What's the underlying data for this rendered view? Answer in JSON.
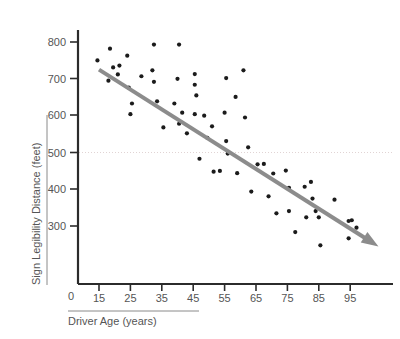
{
  "chart_data": {
    "type": "scatter",
    "title": "",
    "xlabel": "Driver Age (years)",
    "ylabel": "Sign Legibility Distance (feet)",
    "xlim": [
      10,
      102
    ],
    "ylim": [
      200,
      830
    ],
    "xticks": [
      15,
      25,
      35,
      45,
      55,
      65,
      75,
      85,
      95
    ],
    "yticks": [
      300,
      400,
      500,
      600,
      700,
      800
    ],
    "origin_label": "0",
    "grid": false,
    "reference_lines": [
      {
        "axis": "y",
        "value": 500,
        "style": "dotted",
        "color": "#d9c9c9"
      }
    ],
    "legend": "none",
    "annotations": [],
    "colors": {
      "point": "#1b1b1b",
      "trend": "#8c8c8c",
      "axis": "#2b2b2b",
      "text": "#555555",
      "gridline": "#d9c9c9",
      "background": "#ffffff"
    },
    "trend_line": {
      "type": "linear-fit-with-arrow",
      "x_start": 15,
      "y_start": 725,
      "x_end": 104,
      "y_end": 245,
      "color": "#8c8c8c"
    },
    "points": [
      {
        "x": 14.5,
        "y": 750
      },
      {
        "x": 18.5,
        "y": 782
      },
      {
        "x": 18.0,
        "y": 695
      },
      {
        "x": 19.5,
        "y": 731
      },
      {
        "x": 21.5,
        "y": 736
      },
      {
        "x": 21.0,
        "y": 712
      },
      {
        "x": 24.0,
        "y": 763
      },
      {
        "x": 24.5,
        "y": 676
      },
      {
        "x": 25.5,
        "y": 633
      },
      {
        "x": 25.0,
        "y": 604
      },
      {
        "x": 28.5,
        "y": 707
      },
      {
        "x": 32.5,
        "y": 793
      },
      {
        "x": 32.0,
        "y": 723
      },
      {
        "x": 32.5,
        "y": 692
      },
      {
        "x": 33.5,
        "y": 639
      },
      {
        "x": 35.5,
        "y": 568
      },
      {
        "x": 39.0,
        "y": 633
      },
      {
        "x": 40.5,
        "y": 793
      },
      {
        "x": 40.0,
        "y": 700
      },
      {
        "x": 40.5,
        "y": 578
      },
      {
        "x": 41.5,
        "y": 608
      },
      {
        "x": 43.0,
        "y": 552
      },
      {
        "x": 45.5,
        "y": 713
      },
      {
        "x": 45.5,
        "y": 684
      },
      {
        "x": 46.0,
        "y": 655
      },
      {
        "x": 45.5,
        "y": 604
      },
      {
        "x": 47.0,
        "y": 483
      },
      {
        "x": 48.5,
        "y": 600
      },
      {
        "x": 49.5,
        "y": 540
      },
      {
        "x": 51.0,
        "y": 571
      },
      {
        "x": 51.5,
        "y": 448
      },
      {
        "x": 53.5,
        "y": 450
      },
      {
        "x": 55.0,
        "y": 608
      },
      {
        "x": 55.5,
        "y": 702
      },
      {
        "x": 55.5,
        "y": 531
      },
      {
        "x": 56.0,
        "y": 497
      },
      {
        "x": 58.5,
        "y": 651
      },
      {
        "x": 59.0,
        "y": 444
      },
      {
        "x": 61.0,
        "y": 723
      },
      {
        "x": 61.5,
        "y": 595
      },
      {
        "x": 62.5,
        "y": 514
      },
      {
        "x": 63.5,
        "y": 394
      },
      {
        "x": 65.5,
        "y": 468
      },
      {
        "x": 67.5,
        "y": 469
      },
      {
        "x": 69.0,
        "y": 381
      },
      {
        "x": 70.5,
        "y": 443
      },
      {
        "x": 71.5,
        "y": 335
      },
      {
        "x": 74.5,
        "y": 451
      },
      {
        "x": 75.5,
        "y": 404
      },
      {
        "x": 75.5,
        "y": 341
      },
      {
        "x": 77.5,
        "y": 284
      },
      {
        "x": 80.5,
        "y": 407
      },
      {
        "x": 81.0,
        "y": 324
      },
      {
        "x": 82.5,
        "y": 420
      },
      {
        "x": 83.0,
        "y": 375
      },
      {
        "x": 84.0,
        "y": 341
      },
      {
        "x": 85.0,
        "y": 324
      },
      {
        "x": 85.5,
        "y": 248
      },
      {
        "x": 90.0,
        "y": 372
      },
      {
        "x": 94.5,
        "y": 314
      },
      {
        "x": 95.5,
        "y": 316
      },
      {
        "x": 94.5,
        "y": 267
      },
      {
        "x": 97.0,
        "y": 296
      }
    ]
  }
}
